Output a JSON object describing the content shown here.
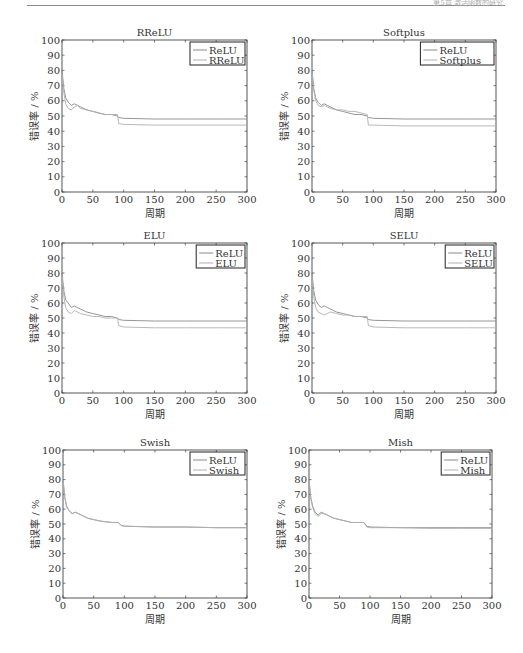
{
  "page": {
    "header_text": "第5章 激活函数的研究"
  },
  "chart_data": [
    {
      "type": "line",
      "title": "RReLU",
      "xlabel": "周期",
      "ylabel": "错误率 / %",
      "xlim": [
        0,
        300
      ],
      "ylim": [
        0,
        100
      ],
      "xticks": [
        0,
        50,
        100,
        150,
        200,
        250,
        300
      ],
      "yticks": [
        0,
        10,
        20,
        30,
        40,
        50,
        60,
        70,
        80,
        90,
        100
      ],
      "legend": [
        "ReLU",
        "RReLU"
      ],
      "legend_position": "upper right",
      "series": [
        {
          "name": "ReLU",
          "x": [
            0,
            3,
            6,
            10,
            15,
            20,
            25,
            30,
            40,
            50,
            60,
            70,
            80,
            90,
            92,
            100,
            150,
            200,
            250,
            300
          ],
          "values": [
            80,
            68,
            62,
            59,
            57,
            58,
            57,
            56,
            54,
            53,
            52,
            51,
            51,
            50,
            49,
            48.5,
            48,
            48,
            48,
            48
          ]
        },
        {
          "name": "RReLU",
          "x": [
            0,
            3,
            6,
            10,
            15,
            20,
            25,
            30,
            40,
            50,
            60,
            70,
            80,
            90,
            92,
            100,
            150,
            200,
            250,
            300
          ],
          "values": [
            78,
            65,
            58,
            55,
            54,
            56,
            57,
            55,
            54,
            53,
            52,
            51,
            51,
            51,
            45,
            44.5,
            44,
            44,
            44,
            44
          ]
        }
      ]
    },
    {
      "type": "line",
      "title": "Softplus",
      "xlabel": "周期",
      "ylabel": "错误率 / %",
      "xlim": [
        0,
        300
      ],
      "ylim": [
        0,
        100
      ],
      "xticks": [
        0,
        50,
        100,
        150,
        200,
        250,
        300
      ],
      "yticks": [
        0,
        10,
        20,
        30,
        40,
        50,
        60,
        70,
        80,
        90,
        100
      ],
      "legend": [
        "ReLU",
        "Softplus"
      ],
      "legend_position": "upper right",
      "series": [
        {
          "name": "ReLU",
          "x": [
            0,
            3,
            6,
            10,
            15,
            20,
            25,
            30,
            40,
            50,
            60,
            70,
            80,
            90,
            92,
            100,
            150,
            200,
            250,
            300
          ],
          "values": [
            80,
            68,
            62,
            59,
            57,
            58,
            57,
            56,
            54,
            53,
            52,
            51,
            51,
            50,
            49,
            48.5,
            48,
            48,
            48,
            48
          ]
        },
        {
          "name": "Softplus",
          "x": [
            0,
            3,
            6,
            10,
            15,
            20,
            25,
            30,
            40,
            50,
            60,
            70,
            80,
            90,
            92,
            100,
            150,
            200,
            250,
            300
          ],
          "values": [
            79,
            67,
            60,
            57,
            56,
            57,
            56,
            55,
            54,
            54,
            53,
            53,
            52,
            51,
            44,
            44,
            43.5,
            43.5,
            43.5,
            43.5
          ]
        }
      ]
    },
    {
      "type": "line",
      "title": "ELU",
      "xlabel": "周期",
      "ylabel": "错误率 / %",
      "xlim": [
        0,
        300
      ],
      "ylim": [
        0,
        100
      ],
      "xticks": [
        0,
        50,
        100,
        150,
        200,
        250,
        300
      ],
      "yticks": [
        0,
        10,
        20,
        30,
        40,
        50,
        60,
        70,
        80,
        90,
        100
      ],
      "legend": [
        "ReLU",
        "ELU"
      ],
      "legend_position": "upper right",
      "series": [
        {
          "name": "ReLU",
          "x": [
            0,
            3,
            6,
            10,
            15,
            20,
            25,
            30,
            40,
            50,
            60,
            70,
            80,
            90,
            92,
            100,
            150,
            200,
            250,
            300
          ],
          "values": [
            80,
            68,
            62,
            60,
            57,
            58,
            57,
            56,
            54,
            53,
            52,
            51,
            51,
            50,
            49,
            48.5,
            48,
            48,
            48,
            48
          ]
        },
        {
          "name": "ELU",
          "x": [
            0,
            3,
            6,
            10,
            15,
            20,
            25,
            30,
            40,
            50,
            60,
            70,
            80,
            90,
            92,
            100,
            150,
            200,
            250,
            300
          ],
          "values": [
            78,
            64,
            57,
            54,
            53,
            55,
            54,
            53,
            52,
            51,
            51,
            50,
            50,
            50,
            45,
            44,
            43.5,
            43.5,
            43.5,
            43.5
          ]
        }
      ]
    },
    {
      "type": "line",
      "title": "SELU",
      "xlabel": "周期",
      "ylabel": "错误率 / %",
      "xlim": [
        0,
        300
      ],
      "ylim": [
        0,
        100
      ],
      "xticks": [
        0,
        50,
        100,
        150,
        200,
        250,
        300
      ],
      "yticks": [
        0,
        10,
        20,
        30,
        40,
        50,
        60,
        70,
        80,
        90,
        100
      ],
      "legend": [
        "ReLU",
        "SELU"
      ],
      "legend_position": "upper right",
      "series": [
        {
          "name": "ReLU",
          "x": [
            0,
            3,
            6,
            10,
            15,
            20,
            25,
            30,
            40,
            50,
            60,
            70,
            80,
            90,
            92,
            100,
            150,
            200,
            250,
            300
          ],
          "values": [
            80,
            68,
            62,
            59,
            57,
            58,
            57,
            56,
            54,
            53,
            52,
            51,
            51,
            50,
            49,
            48.5,
            48,
            48,
            48,
            48
          ]
        },
        {
          "name": "SELU",
          "x": [
            0,
            3,
            6,
            10,
            15,
            20,
            25,
            30,
            40,
            50,
            60,
            70,
            80,
            90,
            92,
            100,
            150,
            200,
            250,
            300
          ],
          "values": [
            78,
            64,
            57,
            54,
            53,
            52,
            53,
            54,
            53,
            52,
            52,
            51,
            51,
            51,
            45,
            44,
            43.5,
            43.5,
            43.5,
            43.5
          ]
        }
      ]
    },
    {
      "type": "line",
      "title": "Swish",
      "xlabel": "周期",
      "ylabel": "错误率 / %",
      "xlim": [
        0,
        300
      ],
      "ylim": [
        0,
        100
      ],
      "xticks": [
        0,
        50,
        100,
        150,
        200,
        250,
        300
      ],
      "yticks": [
        0,
        10,
        20,
        30,
        40,
        50,
        60,
        70,
        80,
        90,
        100
      ],
      "legend": [
        "ReLU",
        "Swish"
      ],
      "legend_position": "upper right",
      "series": [
        {
          "name": "ReLU",
          "x": [
            0,
            3,
            6,
            10,
            15,
            20,
            25,
            30,
            40,
            50,
            60,
            70,
            80,
            90,
            95,
            100,
            150,
            200,
            250,
            300
          ],
          "values": [
            80,
            68,
            62,
            59,
            57,
            58,
            57,
            56,
            54,
            53,
            52,
            51.5,
            51,
            51,
            49,
            48.5,
            48,
            48,
            47.5,
            47.5
          ]
        },
        {
          "name": "Swish",
          "x": [
            0,
            3,
            6,
            10,
            15,
            20,
            25,
            30,
            40,
            50,
            60,
            70,
            80,
            90,
            95,
            100,
            150,
            200,
            250,
            300
          ],
          "values": [
            80,
            68,
            61,
            59,
            57,
            58,
            57,
            56,
            54,
            53,
            52,
            51.5,
            51,
            51,
            49,
            48.5,
            48,
            48,
            47.5,
            47.5
          ]
        }
      ]
    },
    {
      "type": "line",
      "title": "Mish",
      "xlabel": "周期",
      "ylabel": "错误率 / %",
      "xlim": [
        0,
        300
      ],
      "ylim": [
        0,
        100
      ],
      "xticks": [
        0,
        50,
        100,
        150,
        200,
        250,
        300
      ],
      "yticks": [
        0,
        10,
        20,
        30,
        40,
        50,
        60,
        70,
        80,
        90,
        100
      ],
      "legend": [
        "ReLU",
        "Mish"
      ],
      "legend_position": "upper right",
      "series": [
        {
          "name": "ReLU",
          "x": [
            0,
            3,
            6,
            10,
            15,
            20,
            25,
            30,
            40,
            50,
            60,
            70,
            80,
            90,
            95,
            100,
            150,
            200,
            250,
            300
          ],
          "values": [
            80,
            68,
            62,
            58,
            56,
            58,
            57,
            56,
            54,
            53,
            52,
            51,
            51,
            51,
            48.5,
            48,
            47.5,
            47.5,
            47.5,
            47.5
          ]
        },
        {
          "name": "Mish",
          "x": [
            0,
            3,
            6,
            10,
            15,
            20,
            25,
            30,
            40,
            50,
            60,
            70,
            80,
            90,
            95,
            100,
            150,
            200,
            250,
            300
          ],
          "values": [
            80,
            67,
            61,
            57,
            55,
            57,
            57,
            56,
            54,
            53,
            52,
            51,
            51,
            51,
            48,
            47.5,
            47.5,
            47,
            47,
            47
          ]
        }
      ]
    }
  ],
  "layout": {
    "panels": [
      {
        "x0": 62,
        "x1": 247,
        "y0": 40,
        "y1": 192
      },
      {
        "x0": 312,
        "x1": 496,
        "y0": 40,
        "y1": 192
      },
      {
        "x0": 62,
        "x1": 247,
        "y0": 243,
        "y1": 393
      },
      {
        "x0": 312,
        "x1": 496,
        "y0": 243,
        "y1": 393
      },
      {
        "x0": 63,
        "x1": 247,
        "y0": 450,
        "y1": 598
      },
      {
        "x0": 309,
        "x1": 492,
        "y0": 450,
        "y1": 598
      }
    ],
    "colors": {
      "series0": "#8a8a8a",
      "series1": "#b0b0b0",
      "axis": "#444444"
    }
  }
}
